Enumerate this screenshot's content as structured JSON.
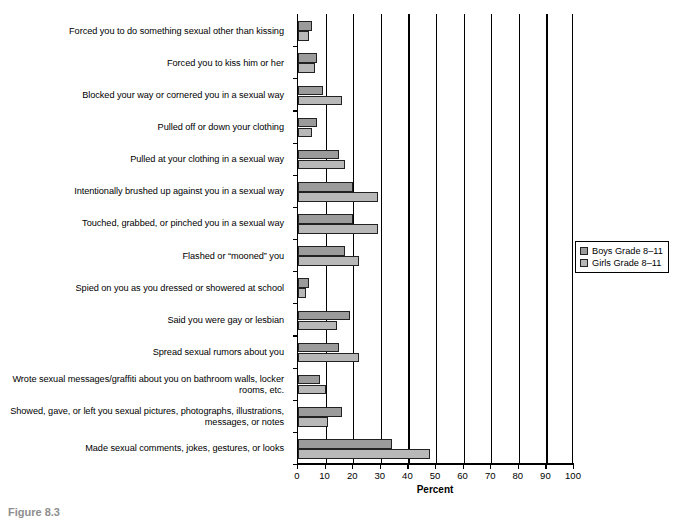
{
  "chart_data": {
    "type": "bar",
    "orientation": "horizontal",
    "title": "",
    "xlabel": "Percent",
    "ylabel": "",
    "xlim": [
      0,
      100
    ],
    "xticks": [
      0,
      10,
      20,
      30,
      40,
      50,
      60,
      70,
      80,
      90,
      100
    ],
    "grid": true,
    "legend_position": "right",
    "categories": [
      "Forced you to do something sexual other than kissing",
      "Forced you to kiss him or her",
      "Blocked  your way or cornered you in a sexual way",
      "Pulled off or down your clothing",
      "Pulled at your clothing in a sexual way",
      "Intentionally brushed up against you in a sexual way",
      "Touched, grabbed, or pinched you in a sexual way",
      "Flashed or “mooned” you",
      "Spied on you as you dressed or showered at school",
      "Said you were gay or lesbian",
      "Spread sexual rumors about you",
      "Wrote sexual messages/graffiti about you on bathroom walls, locker rooms, etc.",
      "Showed, gave, or left you sexual pictures, photographs, illustrations, messages, or notes",
      "Made sexual comments, jokes, gestures, or looks"
    ],
    "series": [
      {
        "name": "Boys Grade 8–11",
        "color": "#9b9b9b",
        "values": [
          5,
          7,
          9,
          7,
          15,
          20,
          20,
          17,
          4,
          19,
          15,
          8,
          16,
          34
        ]
      },
      {
        "name": "Girls Grade 8–11",
        "color": "#b8b8b8",
        "values": [
          4,
          6,
          16,
          5,
          17,
          29,
          29,
          22,
          3,
          14,
          22,
          10,
          11,
          48
        ]
      }
    ]
  },
  "legend": {
    "items": [
      {
        "label": "Boys Grade 8–11",
        "swatch": "boys"
      },
      {
        "label": "Girls Grade 8–11",
        "swatch": "girls"
      }
    ]
  },
  "axis": {
    "x_title": "Percent",
    "tick_labels": [
      "0",
      "10",
      "20",
      "30",
      "40",
      "50",
      "60",
      "70",
      "80",
      "90",
      "100"
    ]
  },
  "caption": {
    "text": "Figure 8.3"
  }
}
